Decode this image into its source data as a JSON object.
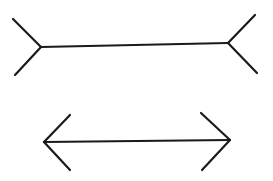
{
  "figure": {
    "stroke_color": "#1a1a1a",
    "background": "#ffffff",
    "top_figure": {
      "type": "fins-out",
      "shaft": [
        [
          41,
          47
        ],
        [
          228,
          43
        ]
      ],
      "fins": [
        [
          [
            13,
            19
          ],
          [
            41,
            47
          ]
        ],
        [
          [
            15,
            75
          ],
          [
            41,
            47
          ]
        ],
        [
          [
            255,
            15
          ],
          [
            228,
            43
          ]
        ],
        [
          [
            257,
            73
          ],
          [
            228,
            43
          ]
        ]
      ]
    },
    "bottom_figure": {
      "type": "arrows-in",
      "shaft": [
        [
          44,
          142
        ],
        [
          230,
          140
        ]
      ],
      "fins": [
        [
          [
            70,
            115
          ],
          [
            44,
            142
          ]
        ],
        [
          [
            70,
            170
          ],
          [
            44,
            142
          ]
        ],
        [
          [
            201,
            113
          ],
          [
            230,
            140
          ]
        ],
        [
          [
            202,
            170
          ],
          [
            230,
            140
          ]
        ]
      ]
    }
  }
}
